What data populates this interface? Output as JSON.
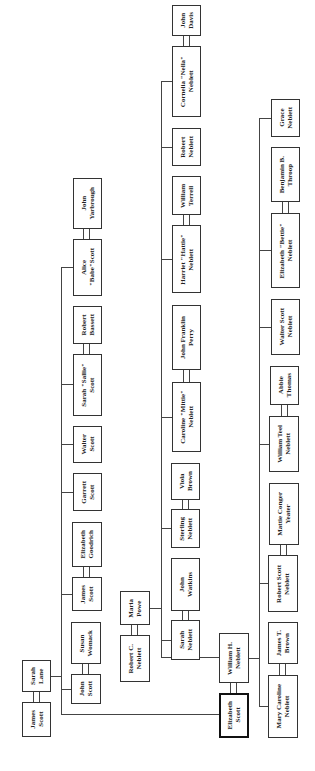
{
  "diagram": {
    "type": "family-tree",
    "orientation": "rotated-90-ccw",
    "focus_person": "Elizabeth Scott",
    "people": [
      {
        "id": "james_scott_sr",
        "name": "James\nScott",
        "x": 22,
        "y": 702,
        "w": 29,
        "h": 35
      },
      {
        "id": "sarah_lane",
        "name": "Sarah\nLane",
        "x": 22,
        "y": 660,
        "w": 29,
        "h": 32
      },
      {
        "id": "john_yarbrough",
        "name": "John\nYarbrough",
        "x": 73,
        "y": 178,
        "w": 29,
        "h": 51
      },
      {
        "id": "alice_scott",
        "name": "Alice\n\"Babe\"Scott",
        "x": 73,
        "y": 239,
        "w": 29,
        "h": 57
      },
      {
        "id": "robert_bassett",
        "name": "Robert\nBassett",
        "x": 73,
        "y": 306,
        "w": 29,
        "h": 38
      },
      {
        "id": "sarah_scott",
        "name": "Sarah \"Sallie\"\nScott",
        "x": 73,
        "y": 354,
        "w": 29,
        "h": 62
      },
      {
        "id": "walter_scott",
        "name": "Walter\nScott",
        "x": 73,
        "y": 426,
        "w": 29,
        "h": 37
      },
      {
        "id": "garrett_scott",
        "name": "Garrett\nScott",
        "x": 73,
        "y": 473,
        "w": 29,
        "h": 38
      },
      {
        "id": "elizabeth_goodrich",
        "name": "Elizabeth\nGoodrich",
        "x": 72,
        "y": 522,
        "w": 30,
        "h": 45
      },
      {
        "id": "james_scott",
        "name": "James\nScott",
        "x": 72,
        "y": 577,
        "w": 30,
        "h": 34
      },
      {
        "id": "susan_womack",
        "name": "Susan\nWomack",
        "x": 71,
        "y": 622,
        "w": 30,
        "h": 42
      },
      {
        "id": "john_scott",
        "name": "John\nScott",
        "x": 71,
        "y": 674,
        "w": 30,
        "h": 30
      },
      {
        "id": "maria_powe",
        "name": "Maria\nPowe",
        "x": 120,
        "y": 591,
        "w": 30,
        "h": 34
      },
      {
        "id": "robert_c_neblett",
        "name": "Robert C.\nNeblett",
        "x": 120,
        "y": 635,
        "w": 30,
        "h": 47
      },
      {
        "id": "john_davis",
        "name": "John\nDavis",
        "x": 172,
        "y": 5,
        "w": 29,
        "h": 31
      },
      {
        "id": "cornelia_neblett",
        "name": "Cornelia \"Nella\"\nNeblett",
        "x": 172,
        "y": 46,
        "w": 29,
        "h": 71
      },
      {
        "id": "robert_neblett",
        "name": "Robert\nNeblett",
        "x": 172,
        "y": 128,
        "w": 29,
        "h": 38
      },
      {
        "id": "william_terrell",
        "name": "William\nTerrell",
        "x": 172,
        "y": 176,
        "w": 29,
        "h": 39
      },
      {
        "id": "harriet_neblett",
        "name": "Harriet \"Hattie\"\nNeblett",
        "x": 172,
        "y": 225,
        "w": 29,
        "h": 68
      },
      {
        "id": "john_franklin_perry",
        "name": "John Franklin\nPerry",
        "x": 172,
        "y": 305,
        "w": 29,
        "h": 65
      },
      {
        "id": "caroline_neblett",
        "name": "Caroline \"Mittie\"\nNeblett",
        "x": 172,
        "y": 382,
        "w": 29,
        "h": 70
      },
      {
        "id": "viola_brown",
        "name": "Viola\nBrown",
        "x": 171,
        "y": 463,
        "w": 29,
        "h": 37
      },
      {
        "id": "sterling_neblett",
        "name": "Sterling\nNeblett",
        "x": 171,
        "y": 509,
        "w": 29,
        "h": 39
      },
      {
        "id": "john_watkins",
        "name": "John\nWatkins",
        "x": 171,
        "y": 558,
        "w": 29,
        "h": 53
      },
      {
        "id": "sarah_neblett",
        "name": "Sarah\nNeblett",
        "x": 171,
        "y": 620,
        "w": 29,
        "h": 40
      },
      {
        "id": "william_h_neblett",
        "name": "William H.\nNeblett",
        "x": 219,
        "y": 633,
        "w": 30,
        "h": 50
      },
      {
        "id": "elizabeth_scott",
        "name": "Elizabeth\nScott",
        "x": 219,
        "y": 693,
        "w": 30,
        "h": 45,
        "focus": true
      },
      {
        "id": "grace_neblett",
        "name": "Grace\nNeblett",
        "x": 271,
        "y": 99,
        "w": 29,
        "h": 38
      },
      {
        "id": "benjamin_throop",
        "name": "Benjamin B.\nThroop",
        "x": 271,
        "y": 147,
        "w": 29,
        "h": 55
      },
      {
        "id": "elizabeth_neblett",
        "name": "Elizabeth \"Bettie\"\nNeblett",
        "x": 271,
        "y": 213,
        "w": 29,
        "h": 75
      },
      {
        "id": "walter_scott_neblett",
        "name": "Walter Scott\nNeblett",
        "x": 271,
        "y": 299,
        "w": 29,
        "h": 56
      },
      {
        "id": "abbie_thomas",
        "name": "Abbie\nThomas",
        "x": 270,
        "y": 366,
        "w": 29,
        "h": 39
      },
      {
        "id": "william_teel_neblett",
        "name": "William Teel\nNeblett",
        "x": 269,
        "y": 416,
        "w": 30,
        "h": 56
      },
      {
        "id": "mattie_yeater",
        "name": "Mattie Conger\nYeater",
        "x": 269,
        "y": 483,
        "w": 30,
        "h": 62
      },
      {
        "id": "robert_scott_neblett",
        "name": "Robert Scott\nNeblett",
        "x": 268,
        "y": 555,
        "w": 30,
        "h": 57
      },
      {
        "id": "james_t_brown",
        "name": "James T.\nBrown",
        "x": 268,
        "y": 622,
        "w": 30,
        "h": 42
      },
      {
        "id": "mary_caroline_neblett",
        "name": "Mary Caroline\nNeblett",
        "x": 268,
        "y": 675,
        "w": 30,
        "h": 63
      }
    ],
    "marriages": [
      {
        "x": 33,
        "y": 692,
        "w": 7,
        "h": 10
      },
      {
        "x": 83,
        "y": 229,
        "w": 7,
        "h": 10
      },
      {
        "x": 83,
        "y": 344,
        "w": 7,
        "h": 10
      },
      {
        "x": 83,
        "y": 567,
        "w": 7,
        "h": 10
      },
      {
        "x": 82,
        "y": 664,
        "w": 7,
        "h": 10
      },
      {
        "x": 131,
        "y": 625,
        "w": 7,
        "h": 10
      },
      {
        "x": 183,
        "y": 36,
        "w": 7,
        "h": 10
      },
      {
        "x": 183,
        "y": 215,
        "w": 7,
        "h": 10
      },
      {
        "x": 183,
        "y": 370,
        "w": 7,
        "h": 12
      },
      {
        "x": 182,
        "y": 500,
        "w": 7,
        "h": 9
      },
      {
        "x": 182,
        "y": 611,
        "w": 7,
        "h": 9
      },
      {
        "x": 230,
        "y": 683,
        "w": 7,
        "h": 10
      },
      {
        "x": 282,
        "y": 202,
        "w": 7,
        "h": 11
      },
      {
        "x": 281,
        "y": 405,
        "w": 7,
        "h": 11
      },
      {
        "x": 280,
        "y": 545,
        "w": 7,
        "h": 10
      },
      {
        "x": 279,
        "y": 664,
        "w": 7,
        "h": 11
      }
    ],
    "lines": [
      {
        "x": 51,
        "y": 676,
        "w": 11,
        "h": 1
      },
      {
        "x": 61,
        "y": 267,
        "w": 1,
        "h": 448
      },
      {
        "x": 61,
        "y": 714,
        "w": 158,
        "h": 1
      },
      {
        "x": 61,
        "y": 267,
        "w": 12,
        "h": 1
      },
      {
        "x": 61,
        "y": 384,
        "w": 12,
        "h": 1
      },
      {
        "x": 61,
        "y": 444,
        "w": 12,
        "h": 1
      },
      {
        "x": 61,
        "y": 492,
        "w": 12,
        "h": 1
      },
      {
        "x": 61,
        "y": 594,
        "w": 11,
        "h": 1
      },
      {
        "x": 61,
        "y": 689,
        "w": 10,
        "h": 1
      },
      {
        "x": 150,
        "y": 608,
        "w": 11,
        "h": 1
      },
      {
        "x": 161,
        "y": 81,
        "w": 1,
        "h": 577
      },
      {
        "x": 161,
        "y": 81,
        "w": 11,
        "h": 1
      },
      {
        "x": 161,
        "y": 147,
        "w": 11,
        "h": 1
      },
      {
        "x": 161,
        "y": 259,
        "w": 11,
        "h": 1
      },
      {
        "x": 161,
        "y": 417,
        "w": 11,
        "h": 1
      },
      {
        "x": 161,
        "y": 528,
        "w": 10,
        "h": 1
      },
      {
        "x": 161,
        "y": 640,
        "w": 10,
        "h": 1
      },
      {
        "x": 161,
        "y": 657,
        "w": 58,
        "h": 1
      },
      {
        "x": 249,
        "y": 658,
        "w": 10,
        "h": 1
      },
      {
        "x": 259,
        "y": 118,
        "w": 1,
        "h": 589
      },
      {
        "x": 259,
        "y": 118,
        "w": 12,
        "h": 1
      },
      {
        "x": 259,
        "y": 250,
        "w": 12,
        "h": 1
      },
      {
        "x": 259,
        "y": 327,
        "w": 12,
        "h": 1
      },
      {
        "x": 259,
        "y": 444,
        "w": 10,
        "h": 1
      },
      {
        "x": 259,
        "y": 583,
        "w": 9,
        "h": 1
      },
      {
        "x": 259,
        "y": 706,
        "w": 9,
        "h": 1
      }
    ]
  }
}
